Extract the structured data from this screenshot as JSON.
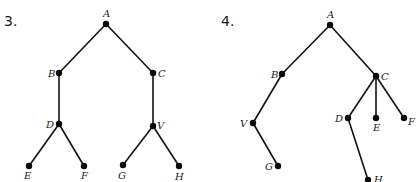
{
  "diagrams": [
    {
      "number": "3.",
      "number_pos": [
        4,
        26
      ],
      "nodes": [
        {
          "id": "A",
          "x": 106,
          "y": 24,
          "lx": 103,
          "ly": 17
        },
        {
          "id": "B",
          "x": 59,
          "y": 73,
          "lx": 48,
          "ly": 77
        },
        {
          "id": "C",
          "x": 153,
          "y": 73,
          "lx": 158,
          "ly": 77
        },
        {
          "id": "D",
          "x": 59,
          "y": 124,
          "lx": 46,
          "ly": 128
        },
        {
          "id": "V",
          "x": 153,
          "y": 126,
          "lx": 157,
          "ly": 129
        },
        {
          "id": "E",
          "x": 29,
          "y": 166,
          "lx": 24,
          "ly": 179
        },
        {
          "id": "F",
          "x": 84,
          "y": 166,
          "lx": 81,
          "ly": 179
        },
        {
          "id": "G",
          "x": 123,
          "y": 165,
          "lx": 118,
          "ly": 179
        },
        {
          "id": "H",
          "x": 179,
          "y": 166,
          "lx": 175,
          "ly": 180
        }
      ],
      "edges": [
        [
          "A",
          "B"
        ],
        [
          "A",
          "C"
        ],
        [
          "B",
          "D"
        ],
        [
          "C",
          "V"
        ],
        [
          "D",
          "E"
        ],
        [
          "D",
          "F"
        ],
        [
          "V",
          "G"
        ],
        [
          "V",
          "H"
        ]
      ]
    },
    {
      "number": "4.",
      "number_pos": [
        221,
        26
      ],
      "nodes": [
        {
          "id": "A",
          "x": 330,
          "y": 25,
          "lx": 327,
          "ly": 18
        },
        {
          "id": "B",
          "x": 282,
          "y": 74,
          "lx": 271,
          "ly": 78
        },
        {
          "id": "C",
          "x": 376,
          "y": 76,
          "lx": 381,
          "ly": 80
        },
        {
          "id": "V",
          "x": 253,
          "y": 123,
          "lx": 240,
          "ly": 127
        },
        {
          "id": "G",
          "x": 278,
          "y": 166,
          "lx": 265,
          "ly": 170
        },
        {
          "id": "D",
          "x": 348,
          "y": 118,
          "lx": 335,
          "ly": 122
        },
        {
          "id": "E",
          "x": 376,
          "y": 118,
          "lx": 373,
          "ly": 131
        },
        {
          "id": "F",
          "x": 404,
          "y": 118,
          "lx": 408,
          "ly": 125
        },
        {
          "id": "H",
          "x": 368,
          "y": 180,
          "lx": 374,
          "ly": 183
        }
      ],
      "edges": [
        [
          "A",
          "B"
        ],
        [
          "A",
          "C"
        ],
        [
          "B",
          "V"
        ],
        [
          "V",
          "G"
        ],
        [
          "C",
          "D"
        ],
        [
          "C",
          "E"
        ],
        [
          "C",
          "F"
        ],
        [
          "D",
          "H"
        ]
      ]
    }
  ]
}
